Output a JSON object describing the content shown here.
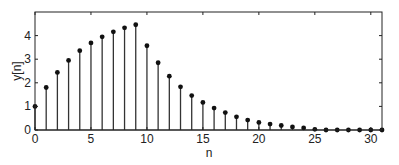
{
  "chart_data": {
    "type": "stem",
    "title": "",
    "xlabel": "n",
    "ylabel": "y[n]",
    "xlim": [
      0,
      31
    ],
    "ylim": [
      0,
      5
    ],
    "xticks": [
      0,
      5,
      10,
      15,
      20,
      25,
      30
    ],
    "yticks": [
      0,
      1,
      2,
      3,
      4
    ],
    "grid": false,
    "legend": null,
    "x": [
      0,
      1,
      2,
      3,
      4,
      5,
      6,
      7,
      8,
      9,
      10,
      11,
      12,
      13,
      14,
      15,
      16,
      17,
      18,
      19,
      20,
      21,
      22,
      23,
      24,
      25,
      26,
      27,
      28,
      29,
      30,
      31
    ],
    "values": [
      1.0,
      1.8,
      2.44,
      2.95,
      3.36,
      3.69,
      3.95,
      4.16,
      4.33,
      4.46,
      3.57,
      2.85,
      2.28,
      1.83,
      1.46,
      1.17,
      0.93,
      0.74,
      0.56,
      0.42,
      0.32,
      0.25,
      0.19,
      0.13,
      0.09,
      0.03,
      0.0,
      0.0,
      0.0,
      0.0,
      0.0,
      0.0
    ]
  },
  "colors": {
    "axis": "#222222",
    "stem": "#333333",
    "marker": "#111111"
  }
}
